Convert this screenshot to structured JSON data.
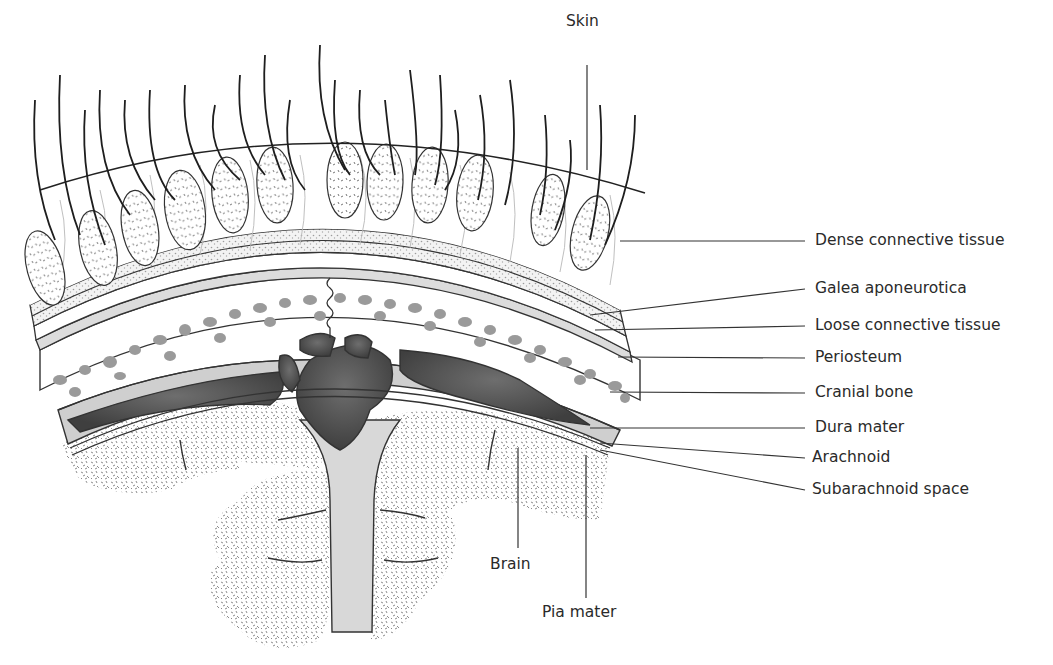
{
  "figure": {
    "type": "anatomical cross-section"
  },
  "labels": {
    "skin": "Skin",
    "dense_connective_tissue": "Dense connective tissue",
    "galea_aponeurotica": "Galea aponeurotica",
    "loose_connective_tissue": "Loose connective tissue",
    "periosteum": "Periosteum",
    "cranial_bone": "Cranial bone",
    "dura_mater": "Dura mater",
    "arachnoid": "Arachnoid",
    "subarachnoid_space": "Subarachnoid space",
    "brain": "Brain",
    "pia_mater": "Pia mater"
  },
  "colors": {
    "ink": "#2a2a2a",
    "line": "#333333",
    "bone_dots": "#9a9a9a",
    "dura": "#c8c8c8",
    "sinus": "#5a5a5a",
    "brain_speckle": "#8c8c8c",
    "background": "#ffffff"
  }
}
